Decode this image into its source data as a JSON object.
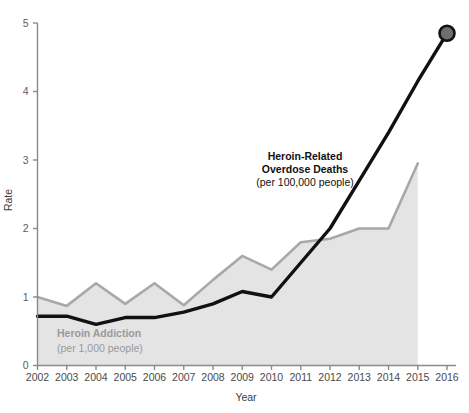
{
  "chart_data": {
    "type": "area",
    "title": "",
    "xlabel": "Year",
    "ylabel": "Rate",
    "xlim": [
      2002,
      2016
    ],
    "ylim": [
      0,
      5
    ],
    "ytick_labels": [
      "0",
      "1",
      "2",
      "3",
      "4",
      "5"
    ],
    "ytick_values": [
      0,
      1,
      2,
      3,
      4,
      5
    ],
    "grid": false,
    "legend_position": "inline-annotation",
    "categories": [
      2002,
      2003,
      2004,
      2005,
      2006,
      2007,
      2008,
      2009,
      2010,
      2011,
      2012,
      2013,
      2014,
      2015,
      2016
    ],
    "xtick_labels": [
      "2002",
      "2003",
      "2004",
      "2005",
      "2006",
      "2007",
      "2008",
      "2009",
      "2010",
      "2011",
      "2012",
      "2013",
      "2014",
      "2015",
      "2016"
    ],
    "series": [
      {
        "name": "Heroin Addiction",
        "unit": "per 1,000 people",
        "style": "filled-area",
        "color": "#a8a8a8",
        "fill": "#e4e4e4",
        "x": [
          2002,
          2003,
          2004,
          2005,
          2006,
          2007,
          2008,
          2009,
          2010,
          2011,
          2012,
          2013,
          2014,
          2015
        ],
        "values": [
          1.0,
          0.87,
          1.2,
          0.9,
          1.2,
          0.88,
          1.25,
          1.6,
          1.4,
          1.8,
          1.85,
          2.0,
          2.0,
          2.95
        ]
      },
      {
        "name": "Heroin-Related Overdose Deaths",
        "unit": "per 100,000 people",
        "style": "line",
        "color": "#111111",
        "endpoint_marker": true,
        "endpoint_marker_color": "#6e6e6e",
        "x": [
          2002,
          2003,
          2004,
          2005,
          2006,
          2007,
          2008,
          2009,
          2010,
          2011,
          2012,
          2013,
          2014,
          2015,
          2016
        ],
        "values": [
          0.72,
          0.72,
          0.6,
          0.7,
          0.7,
          0.78,
          0.9,
          1.08,
          1.0,
          1.5,
          2.0,
          2.7,
          3.4,
          4.15,
          4.85
        ]
      }
    ],
    "annotations": [
      {
        "id": "overdose",
        "line1": "Heroin-Related",
        "line2": "Overdose Deaths",
        "line3": "(per 100,000 people)"
      },
      {
        "id": "addiction",
        "line1": "Heroin Addiction",
        "line2": "(per 1,000 people)"
      }
    ]
  },
  "colors": {
    "background": "#ffffff",
    "area_fill": "#e4e4e4",
    "area_stroke": "#a8a8a8",
    "line_stroke": "#111111",
    "axis": "#8a8a8a",
    "tick_text": "#5d5d5d",
    "marker": "#6e6e6e"
  }
}
